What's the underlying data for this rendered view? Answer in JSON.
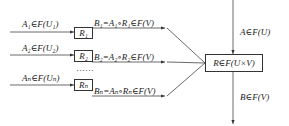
{
  "diagram": {
    "inputs": [
      {
        "label": "A₁∈F(U₁)",
        "relation": "R₁",
        "output": "B₁=A₁∘R₁∈F(V)"
      },
      {
        "label": "A₂∈F(U₂)",
        "relation": "R₂",
        "output": "B₂=A₂∘R₂∈F(V)"
      },
      {
        "label": "Aₙ∈F(Uₙ)",
        "relation": "Rₙ",
        "output": "Bₙ=Aₙ∘Rₙ∈F(V)"
      }
    ],
    "ellipsis": "……",
    "combined": {
      "label": "R∈F(U×V)"
    },
    "top_input": "A∈F(U)",
    "bottom_output": "B∈F(V)"
  }
}
